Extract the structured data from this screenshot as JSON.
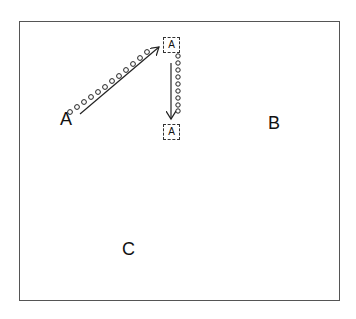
{
  "diagram": {
    "labels": {
      "a": "A",
      "b": "B",
      "c": "C"
    },
    "boxed_labels": {
      "top": "A",
      "bottom": "A"
    },
    "colors": {
      "stroke": "#222222",
      "frame": "#555555",
      "background": "#ffffff"
    },
    "paths": [
      {
        "name": "diagonal-path",
        "from": "A",
        "to": "boxed-A-top",
        "marker": "circles",
        "count": 12
      },
      {
        "name": "vertical-path",
        "from": "boxed-A-top",
        "to": "boxed-A-bottom",
        "marker": "circles",
        "count": 8
      }
    ]
  }
}
